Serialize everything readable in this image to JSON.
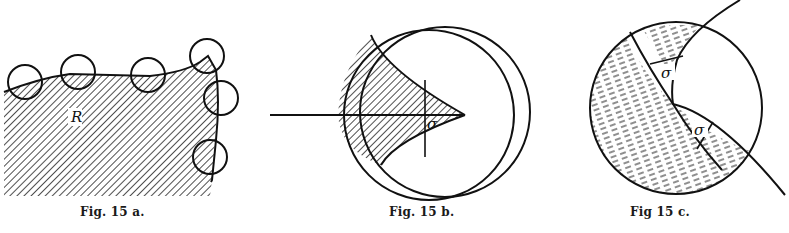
{
  "figures": [
    {
      "id": "fig-15a",
      "caption": "Fig. 15 a.",
      "region_label": "R",
      "description": "Hatched region R with boundary curve traced by small circles"
    },
    {
      "id": "fig-15b",
      "caption": "Fig. 15 b.",
      "angle_label": "σ",
      "description": "Large circle with a hatched wedge region and horizontal axis, angle sigma at vertex"
    },
    {
      "id": "fig-15c",
      "caption": "Fig 15 c.",
      "angle_labels": [
        "σ",
        "σ"
      ],
      "description": "Circle split by curves into shaded regions with two angles sigma"
    }
  ],
  "colors": {
    "ink": "#111111",
    "paper": "#ffffff"
  }
}
